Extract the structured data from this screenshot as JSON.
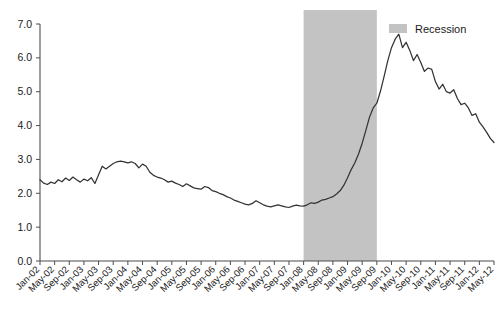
{
  "chart_data": {
    "type": "line",
    "title": "",
    "subtitle": "",
    "xlabel": "",
    "ylabel": "",
    "ylim": [
      0.0,
      7.0
    ],
    "yticks": [
      "0.0",
      "1.0",
      "2.0",
      "3.0",
      "4.0",
      "5.0",
      "6.0",
      "7.0"
    ],
    "ytick_values": [
      0.0,
      1.0,
      2.0,
      3.0,
      4.0,
      5.0,
      6.0,
      7.0
    ],
    "grid": false,
    "legend_position": "top-right",
    "legend": [
      {
        "label": "Recession",
        "type": "band",
        "color": "#c3c3c3"
      }
    ],
    "annotations": [],
    "shaded_regions": [
      {
        "label": "Recession",
        "start": "Jan-08",
        "end": "Sep-09",
        "color": "#c3c3c3"
      }
    ],
    "xtick_labels": [
      "Jan-02",
      "May-02",
      "Sep-02",
      "Jan-03",
      "May-03",
      "Sep-03",
      "Jan-04",
      "May-04",
      "Sep-04",
      "Jan-05",
      "May-05",
      "Sep-05",
      "Jan-06",
      "May-06",
      "Sep-06",
      "Jan-07",
      "May-07",
      "Sep-07",
      "Jan-08",
      "May-08",
      "Sep-08",
      "Jan-09",
      "May-09",
      "Sep-09",
      "Jan-10",
      "May-10",
      "Sep-10",
      "Jan-11",
      "May-11",
      "Sep-11",
      "Jan-12",
      "May-12"
    ],
    "x": [
      "Jan-02",
      "Feb-02",
      "Mar-02",
      "Apr-02",
      "May-02",
      "Jun-02",
      "Jul-02",
      "Aug-02",
      "Sep-02",
      "Oct-02",
      "Nov-02",
      "Dec-02",
      "Jan-03",
      "Feb-03",
      "Mar-03",
      "Apr-03",
      "May-03",
      "Jun-03",
      "Jul-03",
      "Aug-03",
      "Sep-03",
      "Oct-03",
      "Nov-03",
      "Dec-03",
      "Jan-04",
      "Feb-04",
      "Mar-04",
      "Apr-04",
      "May-04",
      "Jun-04",
      "Jul-04",
      "Aug-04",
      "Sep-04",
      "Oct-04",
      "Nov-04",
      "Dec-04",
      "Jan-05",
      "Feb-05",
      "Mar-05",
      "Apr-05",
      "May-05",
      "Jun-05",
      "Jul-05",
      "Aug-05",
      "Sep-05",
      "Oct-05",
      "Nov-05",
      "Dec-05",
      "Jan-06",
      "Feb-06",
      "Mar-06",
      "Apr-06",
      "May-06",
      "Jun-06",
      "Jul-06",
      "Aug-06",
      "Sep-06",
      "Oct-06",
      "Nov-06",
      "Dec-06",
      "Jan-07",
      "Feb-07",
      "Mar-07",
      "Apr-07",
      "May-07",
      "Jun-07",
      "Jul-07",
      "Aug-07",
      "Sep-07",
      "Oct-07",
      "Nov-07",
      "Dec-07",
      "Jan-08",
      "Feb-08",
      "Mar-08",
      "Apr-08",
      "May-08",
      "Jun-08",
      "Jul-08",
      "Aug-08",
      "Sep-08",
      "Oct-08",
      "Nov-08",
      "Dec-08",
      "Jan-09",
      "Feb-09",
      "Mar-09",
      "Apr-09",
      "May-09",
      "Jun-09",
      "Jul-09",
      "Aug-09",
      "Sep-09",
      "Oct-09",
      "Nov-09",
      "Dec-09",
      "Jan-10",
      "Feb-10",
      "Mar-10",
      "Apr-10",
      "May-10",
      "Jun-10",
      "Jul-10",
      "Aug-10",
      "Sep-10",
      "Oct-10",
      "Nov-10",
      "Dec-10",
      "Jan-11",
      "Feb-11",
      "Mar-11",
      "Apr-11",
      "May-11",
      "Jun-11",
      "Jul-11",
      "Aug-11",
      "Sep-11",
      "Oct-11",
      "Nov-11",
      "Dec-11",
      "Jan-12",
      "Feb-12",
      "Mar-12",
      "Apr-12",
      "May-12"
    ],
    "values": [
      2.4,
      2.3,
      2.26,
      2.33,
      2.29,
      2.4,
      2.34,
      2.45,
      2.38,
      2.48,
      2.4,
      2.33,
      2.42,
      2.37,
      2.46,
      2.29,
      2.55,
      2.8,
      2.72,
      2.8,
      2.88,
      2.93,
      2.95,
      2.93,
      2.9,
      2.93,
      2.88,
      2.75,
      2.86,
      2.8,
      2.62,
      2.53,
      2.48,
      2.45,
      2.4,
      2.33,
      2.36,
      2.3,
      2.26,
      2.2,
      2.28,
      2.22,
      2.16,
      2.14,
      2.12,
      2.2,
      2.17,
      2.08,
      2.05,
      2.0,
      1.96,
      1.9,
      1.86,
      1.8,
      1.76,
      1.72,
      1.68,
      1.66,
      1.7,
      1.78,
      1.72,
      1.66,
      1.62,
      1.6,
      1.63,
      1.66,
      1.63,
      1.6,
      1.58,
      1.62,
      1.65,
      1.63,
      1.62,
      1.66,
      1.72,
      1.7,
      1.74,
      1.8,
      1.82,
      1.86,
      1.9,
      1.98,
      2.08,
      2.24,
      2.46,
      2.7,
      2.9,
      3.16,
      3.48,
      3.86,
      4.25,
      4.52,
      4.66,
      5.02,
      5.46,
      5.92,
      6.3,
      6.55,
      6.7,
      6.3,
      6.46,
      6.22,
      5.92,
      6.1,
      5.86,
      5.6,
      5.7,
      5.66,
      5.3,
      5.08,
      5.22,
      5.0,
      4.96,
      5.06,
      4.8,
      4.62,
      4.66,
      4.52,
      4.3,
      4.35,
      4.1,
      3.96,
      3.8,
      3.62,
      3.5
    ]
  }
}
